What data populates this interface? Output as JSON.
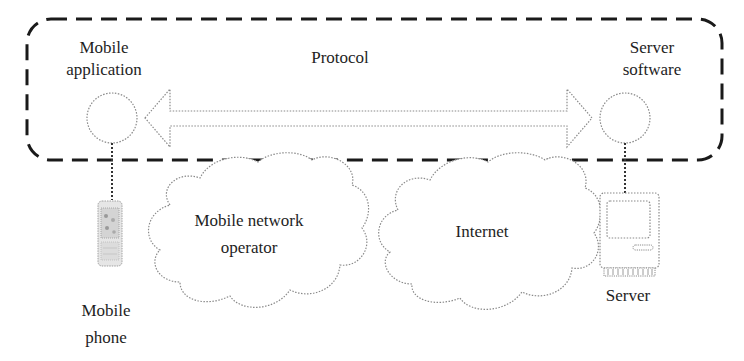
{
  "diagram": {
    "type": "network architecture",
    "system_boundary": {
      "style": "dashed rounded rectangle",
      "color": "#1a1a1a"
    },
    "labels": {
      "mobile_application": [
        "Mobile",
        "application"
      ],
      "server_software": [
        "Server",
        "software"
      ],
      "protocol": "Protocol",
      "mobile_network_operator": [
        "Mobile network",
        "operator"
      ],
      "internet": "Internet",
      "mobile_phone": [
        "Mobile",
        "phone"
      ],
      "server": "Server"
    },
    "nodes": [
      {
        "id": "mobile-application",
        "shape": "circle"
      },
      {
        "id": "server-software",
        "shape": "circle"
      },
      {
        "id": "mobile-network-operator",
        "shape": "cloud"
      },
      {
        "id": "internet",
        "shape": "cloud"
      },
      {
        "id": "mobile-phone",
        "shape": "phone-icon"
      },
      {
        "id": "server",
        "shape": "computer-icon"
      }
    ],
    "edges": [
      {
        "from": "mobile-application",
        "to": "server-software",
        "style": "double-headed block arrow",
        "label": "Protocol"
      },
      {
        "from": "mobile-application",
        "to": "mobile-phone",
        "style": "dotted line"
      },
      {
        "from": "server-software",
        "to": "server",
        "style": "dotted line"
      }
    ],
    "colors": {
      "stroke_light": "#8a8a8a",
      "dash_border": "#1a1a1a",
      "text": "#1e1e1e",
      "background": "#ffffff"
    }
  }
}
